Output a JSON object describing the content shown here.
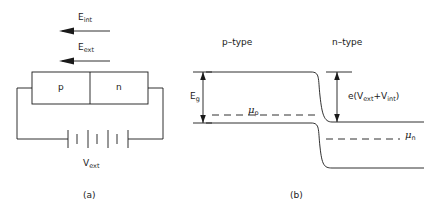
{
  "figure": {
    "panel_a": {
      "caption": "(a)",
      "field_internal_label": "E",
      "field_internal_sub": "int",
      "field_external_label": "E",
      "field_external_sub": "ext",
      "region_p_label": "p",
      "region_n_label": "n",
      "voltage_label": "V",
      "voltage_sub": "ext"
    },
    "panel_b": {
      "caption": "(b)",
      "left_region_label": "p–type",
      "right_region_label": "n–type",
      "gap_label": "E",
      "gap_sub": "g",
      "mu_p_symbol": "μ",
      "mu_p_sub": "p",
      "mu_n_symbol": "μ",
      "mu_n_sub": "n",
      "band_offset_prefix": "e(V",
      "band_offset_sub1": "ext",
      "band_offset_mid": "+V",
      "band_offset_sub2": "int",
      "band_offset_suffix": ")"
    },
    "style": {
      "line_color": "#1a1a1a",
      "background": "#ffffff"
    }
  }
}
